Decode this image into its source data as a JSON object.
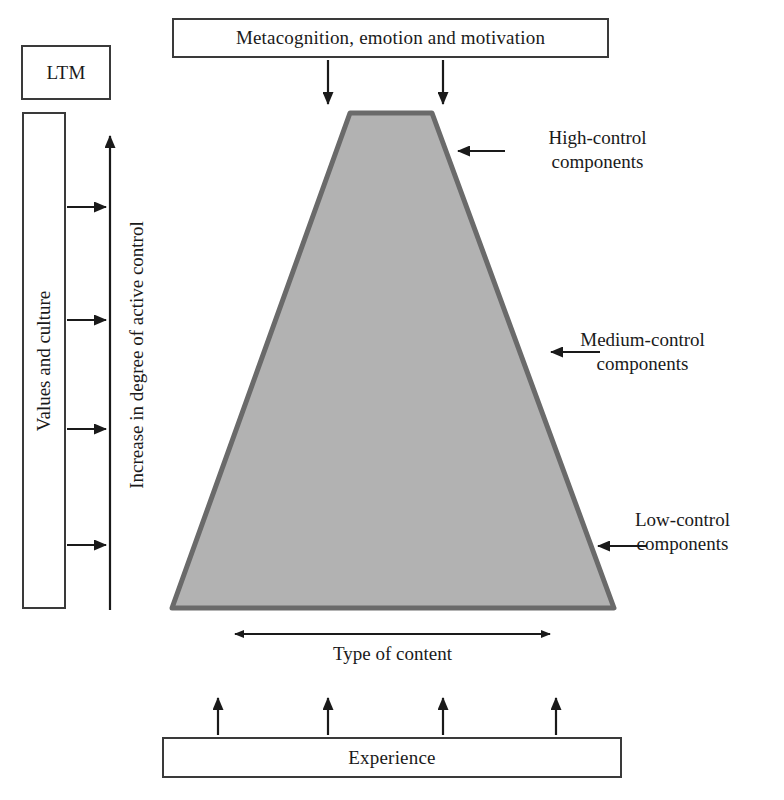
{
  "diagram": {
    "type": "trapezoid-hierarchy"
  },
  "boxes": {
    "metacognition": "Metacognition, emotion and motivation",
    "ltm": "LTM",
    "values_and_culture": "Values and culture",
    "experience": "Experience"
  },
  "axis": {
    "vertical_label": "Increase in degree of active control",
    "horizontal_label": "Type of content"
  },
  "callouts": {
    "high": {
      "line1": "High-control",
      "line2": "components"
    },
    "medium": {
      "line1": "Medium-control",
      "line2": "components"
    },
    "low": {
      "line1": "Low-control",
      "line2": "components"
    }
  },
  "colors": {
    "trapezoid_fill": "#b2b2b2",
    "trapezoid_stroke": "#6a6a6a",
    "line": "#222222",
    "box_border": "#3a3a3a",
    "background": "#ffffff",
    "text": "#1a1a1a"
  },
  "geometry": {
    "trapezoid_top_left_x": 350,
    "trapezoid_top_right_x": 432,
    "trapezoid_top_y": 113,
    "trapezoid_bottom_left_x": 172,
    "trapezoid_bottom_right_x": 614,
    "trapezoid_bottom_y": 608
  },
  "arrows": {
    "values_to_axis_count": 4,
    "metacognition_down_count": 2,
    "experience_up_count": 4,
    "callout_count": 3
  }
}
